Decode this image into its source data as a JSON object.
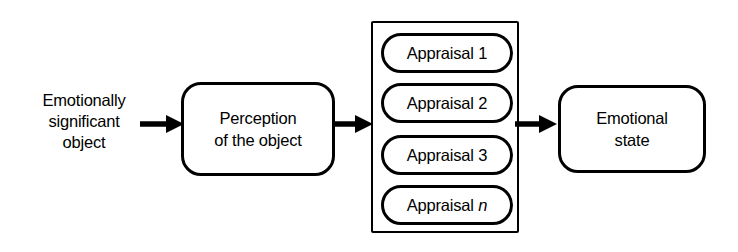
{
  "diagram": {
    "background_color": "#ffffff",
    "stroke_color": "#000000",
    "input": {
      "line1": "Emotionally",
      "line2": "significant",
      "line3": "object"
    },
    "perception": {
      "line1": "Perception",
      "line2": "of the object"
    },
    "appraisals": {
      "items": [
        {
          "label": "Appraisal 1",
          "base": "Appraisal",
          "index": "1",
          "italic_index": false
        },
        {
          "label": "Appraisal 2",
          "base": "Appraisal",
          "index": "2",
          "italic_index": false
        },
        {
          "label": "Appraisal 3",
          "base": "Appraisal",
          "index": "3",
          "italic_index": false
        },
        {
          "label": "Appraisal n",
          "base": "Appraisal",
          "index": "n",
          "italic_index": true
        }
      ]
    },
    "output": {
      "line1": "Emotional",
      "line2": "state"
    },
    "arrows": [
      {
        "name": "object-to-perception",
        "direction": "right"
      },
      {
        "name": "perception-to-appraisals",
        "direction": "right"
      },
      {
        "name": "appraisals-to-emotional-state",
        "direction": "right"
      }
    ]
  }
}
